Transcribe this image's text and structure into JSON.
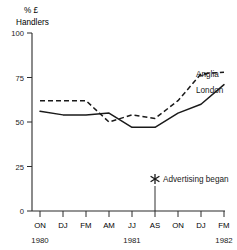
{
  "chart_data": {
    "type": "line",
    "title": "",
    "subtitle": "",
    "ylabel_line1": "% £",
    "ylabel_line2": "Handlers",
    "xlabel": "",
    "ylim": [
      0,
      100
    ],
    "yticks": [
      "0",
      "25",
      "50",
      "75",
      "100"
    ],
    "ytick_values": [
      0,
      25,
      50,
      75,
      100
    ],
    "grid": false,
    "legend_position": "right-inline",
    "categories": [
      "ON",
      "DJ",
      "FM",
      "AM",
      "JJ",
      "AS",
      "ON",
      "DJ",
      "FM"
    ],
    "year_groups": [
      {
        "label": "1980",
        "category_index": 0
      },
      {
        "label": "1981",
        "category_index": 4
      },
      {
        "label": "1982",
        "category_index": 8
      }
    ],
    "series": [
      {
        "name": "Anglia",
        "style": "dashed",
        "values": [
          62,
          62,
          62,
          50,
          54,
          52,
          62,
          77,
          78
        ]
      },
      {
        "name": "London",
        "style": "solid",
        "values": [
          56,
          54,
          54,
          55,
          47,
          47,
          55,
          60,
          71
        ]
      }
    ],
    "annotations": [
      {
        "text": "Advertising began",
        "marker": "asterisk-marker",
        "x_category_fraction": 5.5,
        "y_value": 18
      }
    ]
  }
}
